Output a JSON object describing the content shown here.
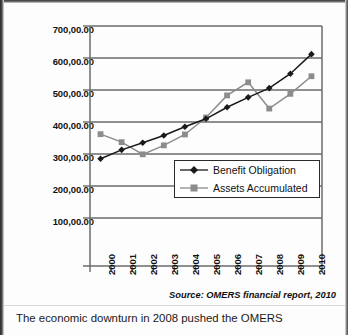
{
  "figure": {
    "source_note": "Source: OMERS financial report, 2010",
    "caption": "The economic downturn in 2008 pushed the OMERS"
  },
  "chart_data": {
    "type": "line",
    "title": "",
    "xlabel": "",
    "ylabel": "",
    "grid": true,
    "legend_position": "inside-lower-right",
    "ylim": [
      0,
      700
    ],
    "ytick_values": [
      100,
      200,
      300,
      400,
      500,
      600,
      700
    ],
    "ytick_labels": [
      "100,00.00",
      "200,00.00",
      "300,00.00",
      "400,00.00",
      "500,00.00",
      "600,00.00",
      "700,00.00"
    ],
    "categories": [
      "2000",
      "2001",
      "2002",
      "2003",
      "2004",
      "2005",
      "2006",
      "2007",
      "2008",
      "2009",
      "2010"
    ],
    "series": [
      {
        "name": "Benefit Obligation",
        "marker": "diamond",
        "color": "#1a1a1a",
        "values": [
          285,
          313,
          335,
          358,
          385,
          410,
          446,
          477,
          506,
          551,
          612
        ]
      },
      {
        "name": "Assets Accumulated",
        "marker": "square",
        "color": "#8c8c8c",
        "values": [
          362,
          337,
          299,
          327,
          361,
          414,
          483,
          524,
          442,
          488,
          543
        ]
      }
    ],
    "colors": {
      "series_1": "#1a1a1a",
      "series_2": "#8c8c8c",
      "axis": "#6b6b6b",
      "grid": "#6b6b6b",
      "background": "#ffffff"
    }
  }
}
